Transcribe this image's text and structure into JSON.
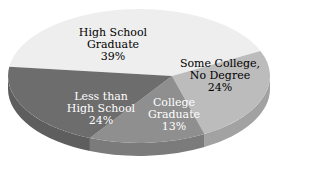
{
  "chart_data": {
    "type": "pie",
    "style": "3d-exploded-none",
    "title": "",
    "categories": [
      "High School Graduate",
      "Some College, No Degree",
      "College Graduate",
      "Less than High School"
    ],
    "values": [
      39,
      24,
      13,
      24
    ],
    "unit": "%",
    "colors": [
      "#eeeeee",
      "#bcbcbc",
      "#8f8f8f",
      "#6d6d6d"
    ],
    "labels": [
      {
        "lines": [
          "High School",
          "Graduate",
          "39%"
        ],
        "color": "#222222"
      },
      {
        "lines": [
          "Some College,",
          "No Degree",
          "24%"
        ],
        "color": "#222222"
      },
      {
        "lines": [
          "College",
          "Graduate",
          "13%"
        ],
        "color": "#ffffff"
      },
      {
        "lines": [
          "Less than",
          "High School",
          "24%"
        ],
        "color": "#ffffff"
      }
    ],
    "legend": "none",
    "grid": false
  }
}
